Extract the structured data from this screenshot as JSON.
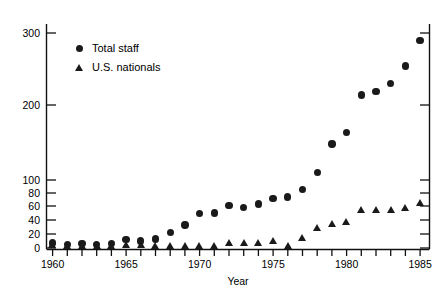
{
  "chart_data": {
    "type": "scatter",
    "title": "",
    "xlabel": "Year",
    "ylabel": "",
    "xlim": [
      1959.3,
      1985.7
    ],
    "ylim": [
      0,
      320
    ],
    "grid": false,
    "y_axis_note": "broken scale: linear 0-100 lower region, compressed 100-300 upper region",
    "xticks": [
      1960,
      1961,
      1962,
      1963,
      1964,
      1965,
      1966,
      1967,
      1968,
      1969,
      1970,
      1971,
      1972,
      1973,
      1974,
      1975,
      1976,
      1977,
      1978,
      1979,
      1980,
      1981,
      1982,
      1983,
      1984,
      1985
    ],
    "xtick_labels": [
      "1960",
      "1965",
      "1970",
      "1975",
      "1980",
      "1985"
    ],
    "xtick_label_values": [
      1960,
      1965,
      1970,
      1975,
      1980,
      1985
    ],
    "yticks": [
      0,
      20,
      40,
      60,
      80,
      100,
      200,
      300
    ],
    "ytick_labels": [
      "0",
      "20",
      "40",
      "60",
      "80",
      "100",
      "200",
      "300"
    ],
    "legend_position": "upper left",
    "series": [
      {
        "name": "Total staff",
        "marker": "circle",
        "color": "#1a1a1a",
        "x": [
          1960,
          1961,
          1962,
          1963,
          1964,
          1965,
          1966,
          1967,
          1968,
          1969,
          1970,
          1971,
          1972,
          1973,
          1974,
          1975,
          1976,
          1977,
          1978,
          1979,
          1980,
          1981,
          1982,
          1983,
          1984,
          1985
        ],
        "values": [
          7,
          5,
          6,
          5,
          6,
          12,
          10,
          13,
          22,
          33,
          49,
          50,
          61,
          58,
          63,
          72,
          74,
          85,
          110,
          148,
          163,
          214,
          219,
          230,
          254,
          290
        ]
      },
      {
        "name": "U.S. nationals",
        "marker": "triangle",
        "color": "#1a1a1a",
        "x": [
          1960,
          1961,
          1962,
          1963,
          1964,
          1965,
          1966,
          1967,
          1968,
          1969,
          1970,
          1971,
          1972,
          1973,
          1974,
          1975,
          1976,
          1977,
          1978,
          1979,
          1980,
          1981,
          1982,
          1983,
          1984,
          1985
        ],
        "values": [
          5,
          3,
          3,
          3,
          3,
          4,
          4,
          3,
          3,
          3,
          3,
          3,
          7,
          7,
          7,
          10,
          3,
          15,
          29,
          35,
          38,
          55,
          55,
          55,
          58,
          65
        ]
      }
    ],
    "legend": [
      {
        "label": "Total staff",
        "marker": "circle"
      },
      {
        "label": "U.S. nationals",
        "marker": "triangle"
      }
    ]
  },
  "axis": {
    "x_title": "Year"
  }
}
